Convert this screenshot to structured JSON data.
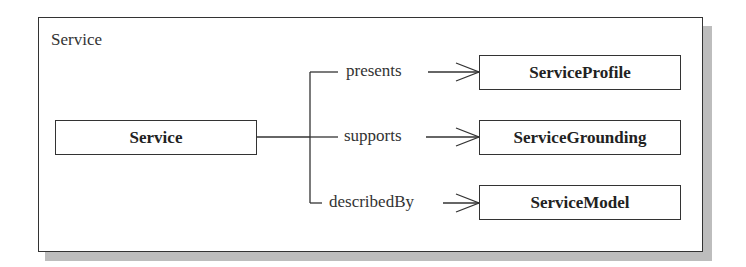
{
  "diagram": {
    "frame_title": "Service",
    "source": {
      "label": "Service"
    },
    "targets": [
      {
        "relation": "presents",
        "label": "ServiceProfile"
      },
      {
        "relation": "supports",
        "label": "ServiceGrounding"
      },
      {
        "relation": "describedBy",
        "label": "ServiceModel"
      }
    ]
  },
  "colors": {
    "line": "#333333",
    "shadow": "#bdbdbd",
    "background": "#ffffff"
  }
}
